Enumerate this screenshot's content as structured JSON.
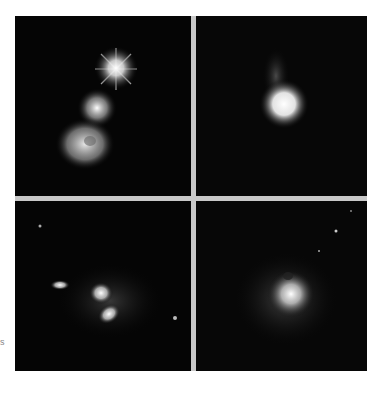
{
  "figure": {
    "panels": [
      {
        "id": "top-left",
        "description": "galaxy merger with bright star and tidal features"
      },
      {
        "id": "top-right",
        "description": "bright compact galaxy with faint tail"
      },
      {
        "id": "bottom-left",
        "description": "interacting galaxy pair with double nucleus"
      },
      {
        "id": "bottom-right",
        "description": "diffuse galaxy with bright core"
      }
    ],
    "side_label": "s",
    "colors": {
      "background": "#ffffff",
      "panel": "#050505",
      "divider": "#c8c8c8"
    }
  }
}
